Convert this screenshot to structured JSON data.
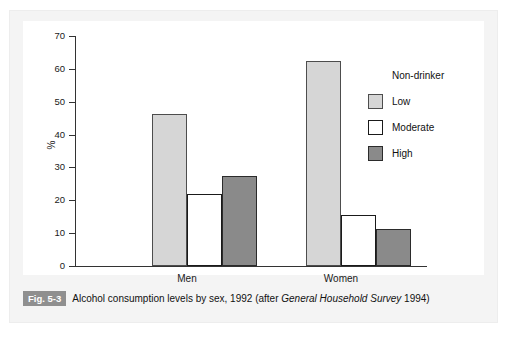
{
  "figure": {
    "badge": "Fig. 5-3",
    "caption_before": "Alcohol consumption levels by sex, 1992 (after ",
    "caption_italic": "General Household Survey",
    "caption_after": " 1994)"
  },
  "legend": {
    "position": "top-right",
    "items": [
      {
        "label": "Non-drinker",
        "color": "#000000"
      },
      {
        "label": "Low",
        "color": "#d6d6d6"
      },
      {
        "label": "Moderate",
        "color": "#ffffff"
      },
      {
        "label": "High",
        "color": "#8a8a8a"
      }
    ]
  },
  "axes": {
    "ylabel": "%",
    "yticks": [
      "70",
      "60",
      "50",
      "40",
      "30",
      "20",
      "10",
      "0"
    ],
    "categories": [
      "Men",
      "Women"
    ]
  },
  "chart_data": {
    "type": "bar",
    "title": "Alcohol consumption levels by sex, 1992 (after General Household Survey 1994)",
    "xlabel": "",
    "ylabel": "%",
    "ylim": [
      0,
      70
    ],
    "ytick_step": 10,
    "grid": false,
    "legend_position": "top-right",
    "categories": [
      "Men",
      "Women"
    ],
    "series": [
      {
        "name": "Non-drinker",
        "color": "#000000",
        "values": [
          5,
          12.4
        ]
      },
      {
        "name": "Low",
        "color": "#d6d6d6",
        "values": [
          46.4,
          62.4
        ]
      },
      {
        "name": "Moderate",
        "color": "#ffffff",
        "values": [
          22,
          15.4
        ]
      },
      {
        "name": "High",
        "color": "#8a8a8a",
        "values": [
          27.4,
          11.3
        ]
      }
    ]
  }
}
